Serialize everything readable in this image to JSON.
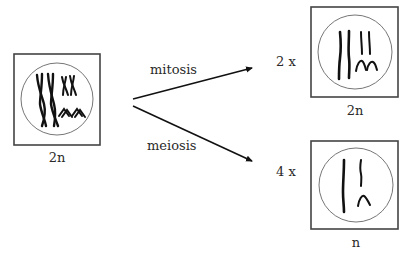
{
  "diagram": {
    "parent_cell": {
      "ploidy_label": "2n"
    },
    "processes": [
      {
        "name": "mitosis",
        "multiplier": "2 x",
        "result_label": "2n"
      },
      {
        "name": "meiosis",
        "multiplier": "4 x",
        "result_label": "n"
      }
    ]
  }
}
